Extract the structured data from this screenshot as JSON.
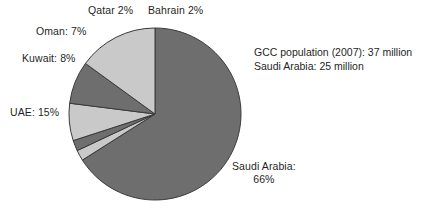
{
  "chart_data": {
    "type": "pie",
    "title": "",
    "categories": [
      "Saudi Arabia",
      "Bahrain",
      "Qatar",
      "Oman",
      "Kuwait",
      "UAE"
    ],
    "values": [
      66,
      2,
      2,
      7,
      8,
      15
    ],
    "unit": "%",
    "legend": "none",
    "grid": false,
    "slices": [
      {
        "name": "Saudi Arabia",
        "value": 66,
        "label": "Saudi Arabia:",
        "value_label": "66%",
        "color": "#6e6e6e"
      },
      {
        "name": "Bahrain",
        "value": 2,
        "label": "Bahrain 2%",
        "value_label": "2%",
        "color": "#c9c9c9"
      },
      {
        "name": "Qatar",
        "value": 2,
        "label": "Qatar 2%",
        "value_label": "2%",
        "color": "#6e6e6e"
      },
      {
        "name": "Oman",
        "value": 7,
        "label": "Oman: 7%",
        "value_label": "7%",
        "color": "#c9c9c9"
      },
      {
        "name": "Kuwait",
        "value": 8,
        "label": "Kuwait: 8%",
        "value_label": "8%",
        "color": "#6e6e6e"
      },
      {
        "name": "UAE",
        "value": 15,
        "label": "UAE: 15%",
        "value_label": "15%",
        "color": "#c9c9c9"
      }
    ],
    "annotations": [
      "GCC population (2007): 37 million",
      "Saudi Arabia: 25 million"
    ],
    "colors": {
      "dark_slice": "#6e6e6e",
      "light_slice": "#c9c9c9",
      "slice_border": "#3a3a3a",
      "background": "#ffffff",
      "text": "#1f1f1f"
    }
  },
  "labels": {
    "qatar": "Qatar 2%",
    "bahrain": "Bahrain 2%",
    "oman": "Oman: 7%",
    "kuwait": "Kuwait: 8%",
    "uae": "UAE: 15%",
    "saudi_name": "Saudi Arabia:",
    "saudi_value": "66%"
  },
  "annotation": {
    "line1": "GCC population (2007): 37 million",
    "line2": "Saudi Arabia: 25 million"
  }
}
